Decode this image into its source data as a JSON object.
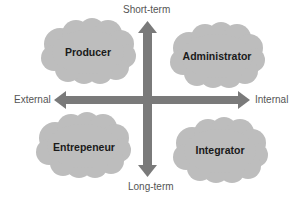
{
  "diagram": {
    "type": "quadrant",
    "colors": {
      "cloud": "#bdbdbd",
      "axis": "#7a7a7a",
      "label_text": "#555555",
      "cloud_text": "#1a1a1a",
      "background": "#ffffff"
    },
    "axes": {
      "top": "Short-term",
      "bottom": "Long-term",
      "left": "External",
      "right": "Internal"
    },
    "quadrants": [
      {
        "position": "top-left",
        "label": "Producer"
      },
      {
        "position": "top-right",
        "label": "Administrator"
      },
      {
        "position": "bottom-left",
        "label": "Entrepeneur"
      },
      {
        "position": "bottom-right",
        "label": "Integrator"
      }
    ]
  }
}
